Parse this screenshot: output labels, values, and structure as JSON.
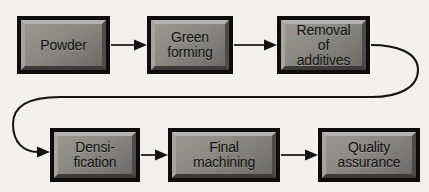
{
  "diagram": {
    "type": "process-flowchart",
    "background_color": "#f4f3f1",
    "box_face_color": "#8e8c87",
    "box_border_color": "#0d0d0d",
    "connector_color": "#121212",
    "nodes": [
      {
        "id": "powder",
        "label": "Powder",
        "row": 1,
        "order": 1,
        "x": 17,
        "y": 16,
        "w": 93,
        "h": 58
      },
      {
        "id": "green-forming",
        "label": "Green\nforming",
        "row": 1,
        "order": 2,
        "x": 147,
        "y": 16,
        "w": 86,
        "h": 58
      },
      {
        "id": "removal-additives",
        "label": "Removal\nof\nadditives",
        "row": 1,
        "order": 3,
        "x": 277,
        "y": 16,
        "w": 93,
        "h": 58
      },
      {
        "id": "densification",
        "label": "Densi-\nfication",
        "row": 2,
        "order": 4,
        "x": 50,
        "y": 128,
        "w": 90,
        "h": 54
      },
      {
        "id": "final-machining",
        "label": "Final\nmachining",
        "row": 2,
        "order": 5,
        "x": 168,
        "y": 128,
        "w": 112,
        "h": 54
      },
      {
        "id": "quality-assurance",
        "label": "Quality\nassurance",
        "row": 2,
        "order": 6,
        "x": 318,
        "y": 128,
        "w": 102,
        "h": 54
      }
    ],
    "connectors": [
      {
        "id": "powder-to-green",
        "from": "powder",
        "to": "green-forming",
        "style": "straight-arrow"
      },
      {
        "id": "green-to-removal",
        "from": "green-forming",
        "to": "removal-additives",
        "style": "straight-arrow"
      },
      {
        "id": "removal-to-densification",
        "from": "removal-additives",
        "to": "densification",
        "style": "wrap-around-loop"
      },
      {
        "id": "densification-to-machining",
        "from": "densification",
        "to": "final-machining",
        "style": "straight-arrow"
      },
      {
        "id": "machining-to-quality",
        "from": "final-machining",
        "to": "quality-assurance",
        "style": "straight-arrow"
      }
    ]
  }
}
